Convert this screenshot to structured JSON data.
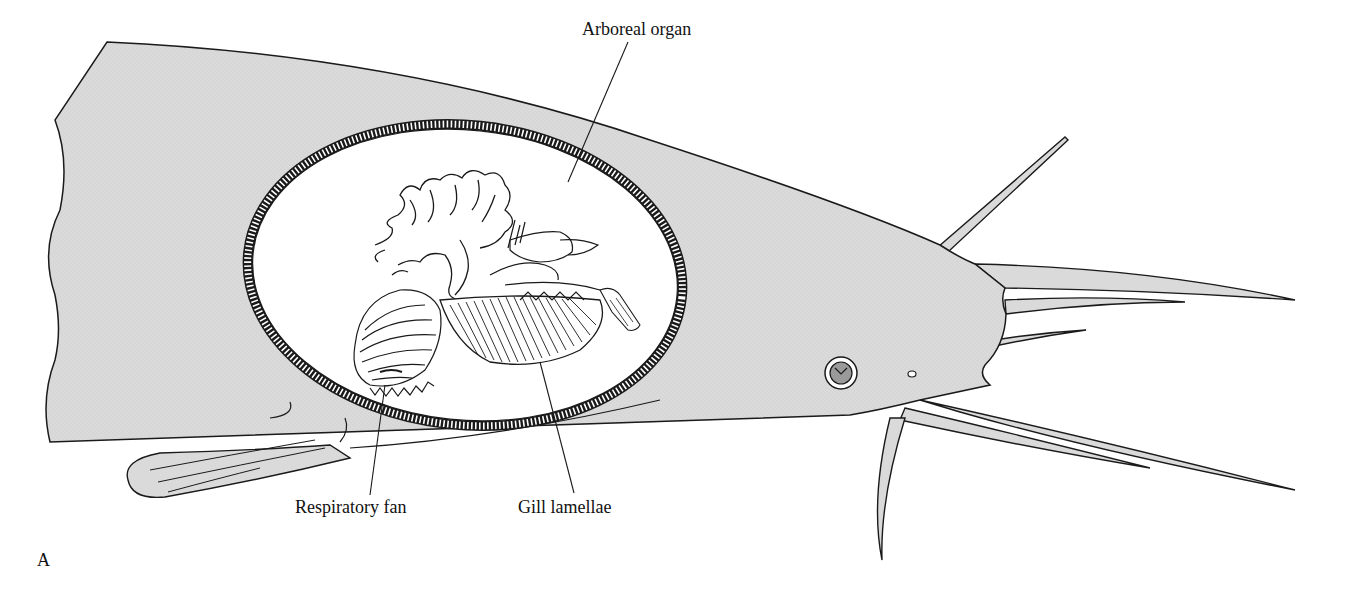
{
  "figure": {
    "panel_letter": "A",
    "labels": {
      "arboreal_organ": "Arboreal organ",
      "respiratory_fan": "Respiratory fan",
      "gill_lamellae": "Gill lamellae"
    },
    "colors": {
      "body_fill": "#d9d9d9",
      "outline": "#1a1a1a",
      "chamber_fill": "#ffffff",
      "eye_iris": "#9a9a9a",
      "background": "#ffffff"
    }
  }
}
